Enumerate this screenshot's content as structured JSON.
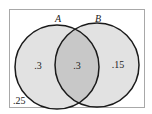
{
  "diagram": {
    "type": "venn",
    "sets": [
      {
        "name": "A",
        "label": "A"
      },
      {
        "name": "B",
        "label": "B"
      }
    ],
    "regions": {
      "a_only": ".3",
      "a_and_b": ".3",
      "b_only": ".15",
      "neither": ".25"
    },
    "colors": {
      "frame": "#a8a8a8",
      "circle_fill": "#e2e2e2",
      "overlap_fill": "#c8c8c8",
      "stroke": "#1a1a1a"
    }
  }
}
